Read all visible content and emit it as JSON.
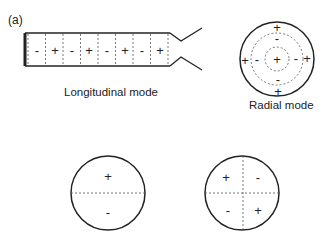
{
  "panel_label": "(a)",
  "longitudinal": {
    "caption": "Longitudinal mode",
    "signs": [
      "-",
      "+",
      "-",
      "+",
      "-",
      "+",
      "-",
      "+"
    ]
  },
  "radial": {
    "caption": "Radial mode",
    "outer_signs": {
      "top": "+",
      "bottom": "+",
      "left": "+",
      "right": "+"
    },
    "middle_signs": {
      "top": "-",
      "bottom": "-",
      "left": "-",
      "right": "-"
    },
    "center_sign": "+"
  },
  "dipole_mode": {
    "top": "+",
    "bottom": "-"
  },
  "quadrupole_mode": {
    "top_left": "+",
    "top_right": "-",
    "bottom_left": "-",
    "bottom_right": "+"
  },
  "colors": {
    "stroke": "#222222",
    "dashed": "#555555",
    "background": "#ffffff"
  }
}
